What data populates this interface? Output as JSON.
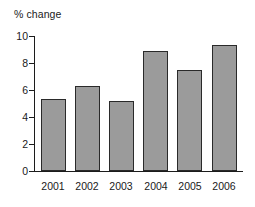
{
  "chart_data": {
    "type": "bar",
    "title": "",
    "ylabel": "% change",
    "xlabel": "",
    "categories": [
      "2001",
      "2002",
      "2003",
      "2004",
      "2005",
      "2006"
    ],
    "values": [
      5.3,
      6.3,
      5.2,
      8.9,
      7.5,
      9.3
    ],
    "ylim": [
      0,
      10
    ],
    "yticks": [
      0,
      2,
      4,
      6,
      8,
      10
    ],
    "ytick_labels": [
      "0",
      "2",
      "4",
      "6",
      "8",
      "10"
    ],
    "grid": false,
    "legend": null,
    "bar_color": "#9b9b9b",
    "bar_edge_color": "#2a2a2a",
    "axis_color": "#1c1c1c",
    "background_color": "#ffffff"
  }
}
